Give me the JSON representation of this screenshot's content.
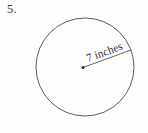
{
  "problem": {
    "number_label": "5.",
    "shape": "circle",
    "measure_label": "7 inches"
  },
  "figure": {
    "circle": {
      "center_x": 85,
      "center_y": 67,
      "radius": 49,
      "stroke_color": "#4a4a4a",
      "stroke_width": 0.9,
      "fill": "none"
    },
    "center_dot": {
      "x": 83,
      "y": 67.5,
      "radius": 1.5,
      "color": "#2b2b2b"
    },
    "radius_line": {
      "x1": 83,
      "y1": 67.5,
      "x2": 131,
      "y2": 50,
      "stroke_color": "#555555",
      "stroke_width": 0.9
    },
    "label_text": {
      "text": "7 inches",
      "x": 88,
      "y": 62,
      "rotation_degrees": -20,
      "color": "#2f2f2f"
    }
  },
  "colors": {
    "background": "#fdfdfd",
    "ink": "#2f2f2f",
    "line": "#4a4a4a"
  }
}
